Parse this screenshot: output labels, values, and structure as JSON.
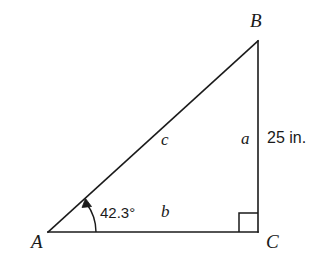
{
  "figure": {
    "kind": "right-triangle-diagram",
    "background_color": "#ffffff",
    "stroke_color": "#1a1a1a",
    "vertices": {
      "A": {
        "label": "A",
        "x": 48,
        "y": 232,
        "label_x": 31,
        "label_y": 232
      },
      "B": {
        "label": "B",
        "x": 258,
        "y": 41,
        "label_x": 250,
        "label_y": 11
      },
      "C": {
        "label": "C",
        "x": 258,
        "y": 232,
        "label_x": 266,
        "label_y": 232
      }
    },
    "sides": {
      "a": {
        "label": "a",
        "label_x": 241,
        "label_y": 130,
        "from": "B",
        "to": "C"
      },
      "b": {
        "label": "b",
        "label_x": 161,
        "label_y": 203,
        "from": "A",
        "to": "C"
      },
      "c": {
        "label": "c",
        "label_x": 161,
        "label_y": 131,
        "from": "A",
        "to": "B"
      }
    },
    "measurement": {
      "label": "25 in.",
      "value": 25,
      "unit": "in.",
      "applies_to_side": "a",
      "label_x": 267,
      "label_y": 130
    },
    "angle": {
      "label": "42.3°",
      "value": 42.3,
      "unit": "degrees",
      "at_vertex": "A",
      "label_x": 100,
      "label_y": 205
    },
    "right_angle": {
      "at_vertex": "C",
      "marker_size": 19
    }
  }
}
